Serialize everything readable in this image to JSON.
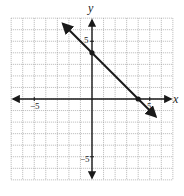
{
  "chart_data": {
    "type": "line",
    "title": "",
    "xlabel": "x",
    "ylabel": "y",
    "xlim": [
      -7,
      7
    ],
    "ylim": [
      -7,
      7
    ],
    "grid": true,
    "tick_labels": {
      "x": [
        {
          "value": -5,
          "label": "−5"
        },
        {
          "value": 5,
          "label": "5"
        }
      ],
      "y": [
        {
          "value": 5,
          "label": "5"
        },
        {
          "value": -5,
          "label": "−5"
        }
      ]
    },
    "series": [
      {
        "name": "y = -x + 4",
        "slope": -1,
        "intercept": 4,
        "x": [
          -2.5,
          0,
          4,
          5.5
        ],
        "y": [
          6.5,
          4,
          0,
          -1.5
        ],
        "arrows_both_ends": true
      }
    ],
    "points": [
      {
        "x": 0,
        "y": 4,
        "label": "y-intercept"
      },
      {
        "x": 4,
        "y": 0,
        "label": "x-intercept"
      }
    ]
  },
  "labels": {
    "x_axis": "x",
    "y_axis": "y",
    "x_neg5": "−5",
    "x_pos5": "5",
    "y_pos5": "5",
    "y_neg5": "−5"
  },
  "colors": {
    "grid": "#9a9a9a",
    "axis": "#1a1a1a",
    "line": "#1a1a1a"
  }
}
